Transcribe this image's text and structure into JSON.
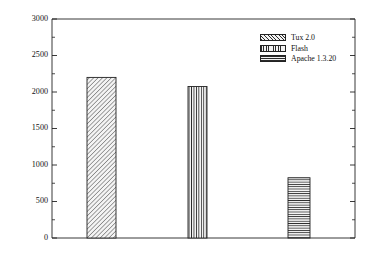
{
  "chart_data": {
    "type": "bar",
    "title": "",
    "xlabel": "",
    "ylabel": "Server Throughput in HTTP ops/sec",
    "categories": [
      "Tux 2.0",
      "Flash",
      "Apache 1.3.20"
    ],
    "values": [
      2200,
      2075,
      825
    ],
    "ylim": [
      0,
      3000
    ],
    "ytick_labels": [
      "0",
      "500",
      "1000",
      "1500",
      "2000",
      "2500",
      "3000"
    ],
    "ytick_values": [
      0,
      500,
      1000,
      1500,
      2000,
      2500,
      3000
    ],
    "minor_tick_interval": 250,
    "grid": false,
    "legend_position": "top-right",
    "legend": [
      {
        "label": "Tux 2.0",
        "pattern": "diagonal-hatch"
      },
      {
        "label": "Flash",
        "pattern": "vertical-lines"
      },
      {
        "label": "Apache 1.3.20",
        "pattern": "horizontal-lines"
      }
    ],
    "series": [
      {
        "name": "Tux 2.0",
        "value": 2200,
        "pattern": "diagonal-hatch"
      },
      {
        "name": "Flash",
        "value": 2075,
        "pattern": "vertical-lines"
      },
      {
        "name": "Apache 1.3.20",
        "value": 825,
        "pattern": "horizontal-lines"
      }
    ]
  },
  "colors": {
    "axis": "#222222",
    "hatch": "#2b2b2b",
    "bar_fill": "#f2f2f2",
    "background": "#ffffff",
    "text": "#121212"
  }
}
